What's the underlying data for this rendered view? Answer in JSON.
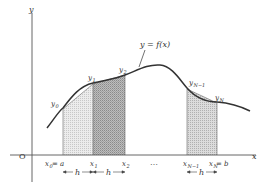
{
  "figure": {
    "type": "trapezoidal-rule-diagram",
    "axis_labels": {
      "y": "y",
      "x": "x",
      "origin": "O"
    },
    "curve_label": "y = f(x)",
    "ordinate_labels": [
      {
        "base": "y",
        "sub": "0"
      },
      {
        "base": "y",
        "sub": "1"
      },
      {
        "base": "y",
        "sub": "2"
      },
      {
        "base": "y",
        "sub": "N−1"
      },
      {
        "base": "y",
        "sub": "N"
      }
    ],
    "abscissa_labels": [
      {
        "base": "x",
        "sub": "0",
        "suffix": " = a"
      },
      {
        "base": "x",
        "sub": "1",
        "suffix": ""
      },
      {
        "base": "x",
        "sub": "2",
        "suffix": ""
      },
      {
        "base": "x",
        "sub": "N−1",
        "suffix": ""
      },
      {
        "base": "x",
        "sub": "N",
        "suffix": " = b"
      }
    ],
    "ellipsis": "…",
    "step_label": "h",
    "colors": {
      "axis": "#555555",
      "curve": "#333333",
      "light_fill": "#e2e2e2",
      "dark_fill": "#b5b5b5",
      "text": "#333333"
    }
  }
}
